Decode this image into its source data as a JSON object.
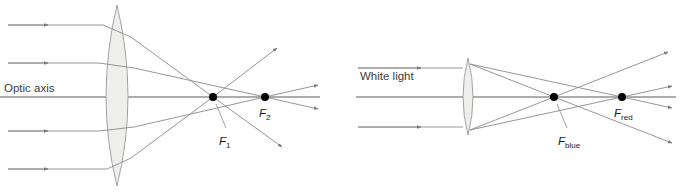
{
  "figure": {
    "background_color": "#ffffff",
    "ray_color": "#8a8a8a",
    "axis_color": "#5a5a5a",
    "lens_fill": "#eeeeec",
    "lens_stroke": "#9a9a9a",
    "dot_color": "#000000"
  },
  "left_diagram": {
    "name": "spherical-aberration",
    "axis_label": "Optic axis",
    "focal_points": [
      {
        "label": "F",
        "subscript": "1",
        "x": 213,
        "y": 97
      },
      {
        "label": "F",
        "subscript": "2",
        "x": 265,
        "y": 97
      }
    ],
    "incoming_ray_y": [
      25,
      63,
      131,
      169
    ],
    "lens": {
      "center_x": 117,
      "top_y": 5,
      "bottom_y": 186,
      "half_width": 20
    }
  },
  "right_diagram": {
    "name": "chromatic-aberration",
    "source_label": "White light",
    "focal_points": [
      {
        "label": "F",
        "subscript": "blue",
        "x": 554,
        "y": 97
      },
      {
        "label": "F",
        "subscript": "red",
        "x": 622,
        "y": 97
      }
    ],
    "incoming_ray_y": [
      68,
      127
    ],
    "lens": {
      "center_x": 468,
      "top_y": 58,
      "bottom_y": 135,
      "half_width": 9
    }
  }
}
